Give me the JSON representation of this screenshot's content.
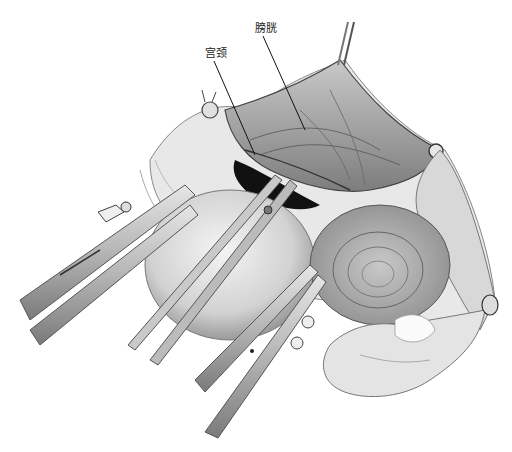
{
  "figure": {
    "type": "surgical-illustration",
    "style": "grayscale pencil drawing",
    "background": "#ffffff",
    "labels": [
      {
        "id": "bladder",
        "text": "膀胱",
        "pointer_from": [
          263,
          36
        ],
        "pointer_to": [
          305,
          130
        ]
      },
      {
        "id": "cervix",
        "text": "宫颈",
        "pointer_from": [
          214,
          61
        ],
        "pointer_to": [
          255,
          155
        ]
      }
    ],
    "depicted_elements": [
      "bladder-peritoneum",
      "cervix",
      "uterus",
      "left-clamp",
      "center-forceps",
      "lower-clamps",
      "right-adnexa",
      "ovary",
      "sutures"
    ],
    "colors": {
      "dark_shadow": "#111111",
      "tissue_mid": "#8a8a8a",
      "tissue_light": "#d8d8d8",
      "instrument": "#bdbdbd",
      "line": "#222222"
    }
  }
}
